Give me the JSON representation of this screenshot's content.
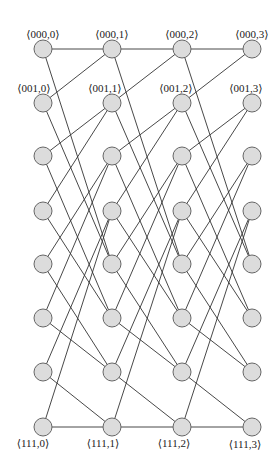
{
  "diagram": {
    "type": "butterfly-shuffle-network",
    "columns": 4,
    "rows": 8,
    "col_x": [
      43,
      112,
      182,
      252
    ],
    "row_y": [
      49,
      103,
      156,
      211,
      264,
      318,
      372,
      427
    ],
    "node_radius": 9,
    "node_fill": "#dcdcdc",
    "node_stroke": "#666666",
    "edge_color": "#333333",
    "edge_rule": "node (r,k) connects to (floor(r/2),k+1) and (floor(r/2)+4,k+1)",
    "top_labels": [
      "⟨000,0⟩",
      "⟨000,1⟩",
      "⟨000,2⟩",
      "⟨000,3⟩"
    ],
    "second_labels": [
      "⟨001,0⟩",
      "⟨001,1⟩",
      "⟨001,2⟩",
      "⟨001,3⟩"
    ],
    "bottom_labels": [
      "⟨111,0⟩",
      "⟨111,1⟩",
      "⟨111,2⟩",
      "⟨111,3⟩"
    ]
  }
}
